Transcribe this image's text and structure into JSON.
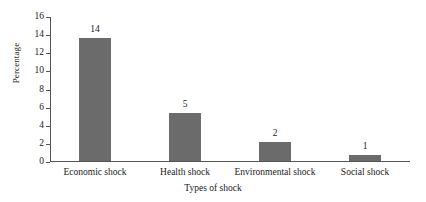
{
  "chart_data": {
    "type": "bar",
    "title": "",
    "xlabel": "Types of shock",
    "ylabel": "Percentage",
    "categories": [
      "Economic shock",
      "Health shock",
      "Environmental shock",
      "Social shock"
    ],
    "values": [
      14,
      5,
      2,
      1
    ],
    "drawn_values": [
      13.7,
      5.3,
      2.1,
      0.7
    ],
    "data_labels": [
      "14",
      "5",
      "2",
      "1"
    ],
    "ylim": [
      0,
      16
    ],
    "ytick_step": 2,
    "yticks": [
      0,
      2,
      4,
      6,
      8,
      10,
      12,
      14,
      16
    ],
    "ytick_labels": [
      "0",
      "2",
      "4",
      "6",
      "8",
      "10",
      "12",
      "14",
      "16"
    ],
    "grid": false,
    "legend": null,
    "bar_color": "#6b6b6b",
    "axis_color": "#555555",
    "background": "#ffffff"
  }
}
